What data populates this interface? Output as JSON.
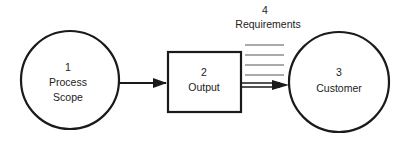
{
  "diagram": {
    "nodes": [
      {
        "id": "1",
        "number": "1",
        "label_line1": "Process",
        "label_line2": "Scope",
        "shape": "circle"
      },
      {
        "id": "2",
        "number": "2",
        "label_line1": "Output",
        "shape": "box"
      },
      {
        "id": "3",
        "number": "3",
        "label_line1": "Customer",
        "shape": "circle"
      }
    ],
    "requirements": {
      "number": "4",
      "label": "Requirements",
      "line_count": 4
    },
    "edges": [
      {
        "from": "1",
        "to": "2",
        "style": "arrow"
      },
      {
        "from": "2",
        "to": "3",
        "style": "double-line-arrow"
      }
    ],
    "colors": {
      "stroke": "#1a1a1a",
      "text": "#222222",
      "requirement_lines": "#555555",
      "background": "#ffffff"
    }
  }
}
